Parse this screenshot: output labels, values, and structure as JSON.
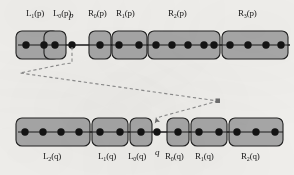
{
  "figure": {
    "type": "diagram",
    "background_color": "#f2f1ee",
    "block_fill": "#a8a8a8",
    "block_stroke": "#222222",
    "node_color": "#141414",
    "line_color": "#1a1a1a",
    "dash_color": "#8c8c8c"
  },
  "rows": [
    {
      "id": "p-row",
      "pivot": {
        "label": "p",
        "cx": 72,
        "cy": 45
      },
      "line": {
        "x1": 18,
        "x2": 290,
        "y": 45
      },
      "blocks": [
        {
          "name": "L1p",
          "label_html": "L<sub>1</sub>(p)",
          "label_text": "L1(p)",
          "x": 16,
          "y": 31,
          "w": 43,
          "h": 28,
          "dots": 2,
          "label_x": 26,
          "label_y": 15
        },
        {
          "name": "L0p",
          "label_html": "L<sub>0</sub>(p)",
          "label_text": "L0(p)",
          "x": 44,
          "y": 31,
          "w": 22,
          "h": 28,
          "dots": 1,
          "label_x": 55,
          "label_y": 15
        },
        {
          "name": "R0p",
          "label_html": "R<sub>0</sub>(p)",
          "label_text": "R0(p)",
          "x": 89,
          "y": 31,
          "w": 22,
          "h": 28,
          "dots": 1,
          "label_x": 91,
          "label_y": 15
        },
        {
          "name": "R1p",
          "label_html": "R<sub>1</sub>(p)",
          "label_text": "R1(p)",
          "x": 112,
          "y": 31,
          "w": 35,
          "h": 28,
          "dots": 2,
          "label_x": 117,
          "label_y": 15
        },
        {
          "name": "R2p",
          "label_html": "R<sub>2</sub>(p)",
          "label_text": "R2(p)",
          "x": 148,
          "y": 31,
          "w": 72,
          "h": 28,
          "dots": 5,
          "label_x": 168,
          "label_y": 15
        },
        {
          "name": "R3p",
          "label_html": "R<sub>3</sub>(p)",
          "label_text": "R3(p)",
          "x": 222,
          "y": 31,
          "w": 66,
          "h": 28,
          "dots": 4,
          "label_x": 238,
          "label_y": 15
        }
      ]
    },
    {
      "id": "q-row",
      "pivot": {
        "label": "q",
        "cx": 155,
        "cy": 132
      },
      "line": {
        "x1": 18,
        "x2": 283,
        "y": 132
      },
      "blocks": [
        {
          "name": "L2q",
          "label_html": "L<sub>2</sub>(q)",
          "label_text": "L2(q)",
          "x": 16,
          "y": 118,
          "w": 74,
          "h": 28,
          "dots": 4,
          "label_x": 44,
          "label_y": 155
        },
        {
          "name": "L1q",
          "label_html": "L<sub>1</sub>(q)",
          "label_text": "L1(q)",
          "x": 92,
          "y": 118,
          "w": 36,
          "h": 28,
          "dots": 2,
          "label_x": 97,
          "label_y": 155
        },
        {
          "name": "L0q",
          "label_html": "L<sub>0</sub>(q)",
          "label_text": "L0(q)",
          "x": 130,
          "y": 118,
          "w": 22,
          "h": 28,
          "dots": 1,
          "label_x": 129,
          "label_y": 155
        },
        {
          "name": "R0q",
          "label_html": "R<sub>0</sub>(q)",
          "label_text": "R0(q)",
          "x": 167,
          "y": 118,
          "w": 22,
          "h": 28,
          "dots": 1,
          "label_x": 164,
          "label_y": 155
        },
        {
          "name": "R1q",
          "label_html": "R<sub>1</sub>(q)",
          "label_text": "R1(q)",
          "x": 191,
          "y": 118,
          "w": 36,
          "h": 28,
          "dots": 2,
          "label_x": 194,
          "label_y": 155
        },
        {
          "name": "R2q",
          "label_html": "R<sub>2</sub>(q)",
          "label_text": "R2(q)",
          "x": 229,
          "y": 118,
          "w": 54,
          "h": 28,
          "dots": 3,
          "label_x": 241,
          "label_y": 155
        }
      ]
    }
  ],
  "pivot_labels": {
    "p": {
      "text": "p",
      "x": 69,
      "y": 15
    },
    "q": {
      "text": "q",
      "x": 152,
      "y": 152
    }
  },
  "connectors": [
    {
      "name": "p-to-fanout",
      "points": "72,47 72,62 66,63 20,73 218,101",
      "style": "dashed"
    },
    {
      "name": "fanout-to-q",
      "points": "218,101 155,120",
      "style": "dashed",
      "arrowhead": "down-left"
    }
  ]
}
